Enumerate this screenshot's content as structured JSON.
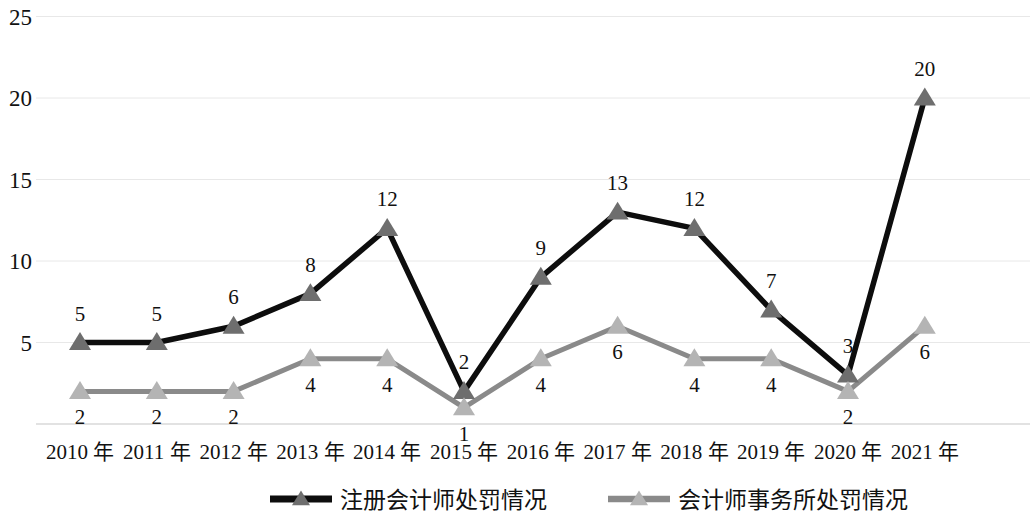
{
  "chart_data": {
    "type": "line",
    "title": "",
    "xlabel": "",
    "ylabel": "",
    "ylim": [
      0,
      25
    ],
    "yticks": [
      5,
      10,
      15,
      20,
      25
    ],
    "grid": true,
    "legend_position": "bottom",
    "categories": [
      "2010 年",
      "2011 年",
      "2012 年",
      "2013 年",
      "2014 年",
      "2015 年",
      "2016 年",
      "2017 年",
      "2018 年",
      "2019 年",
      "2020 年",
      "2021 年"
    ],
    "series": [
      {
        "name": "注册会计师处罚情况",
        "color": "#0d0d0d",
        "marker": "triangle",
        "marker_color": "#6e6e6e",
        "label_offset": "above",
        "values": [
          5,
          5,
          6,
          8,
          12,
          2,
          9,
          13,
          12,
          7,
          3,
          20
        ]
      },
      {
        "name": "会计师事务所处罚情况",
        "color": "#8a8a8a",
        "marker": "triangle",
        "marker_color": "#b4b4b4",
        "label_offset": "below",
        "values": [
          2,
          2,
          2,
          4,
          4,
          1,
          4,
          6,
          4,
          4,
          2,
          6
        ]
      }
    ]
  },
  "axis": {
    "y_tick_labels": [
      "25",
      "20",
      "15",
      "10",
      "5"
    ],
    "grid_color": "#e8e8e8",
    "axis_color": "#d9d9d9"
  }
}
